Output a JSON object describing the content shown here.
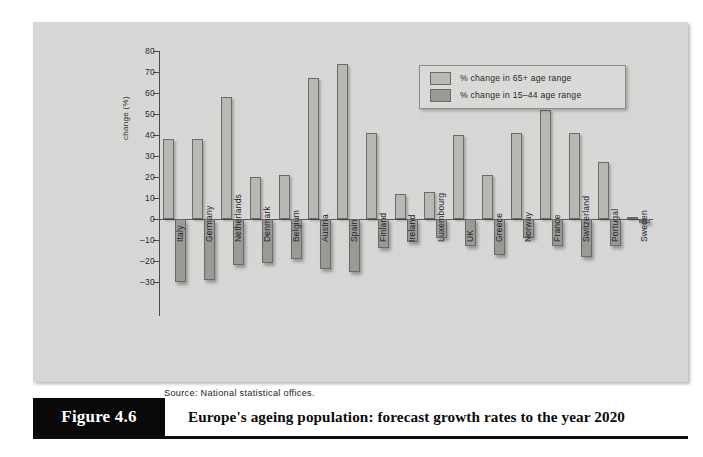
{
  "figure": {
    "number_label": "Figure 4.6",
    "caption": "Europe's ageing population: forecast growth rates to the year 2020",
    "source_note": "Source: National statistical offices."
  },
  "legend": {
    "items": [
      {
        "label": "% change in 65+ age range",
        "color": "#b9b9b6"
      },
      {
        "label": "% change in 15–44 age range",
        "color": "#9a9a97"
      }
    ]
  },
  "axis": {
    "y_title": "change (%)",
    "y_ticks": [
      "80",
      "70",
      "60",
      "50",
      "40",
      "30",
      "20",
      "10",
      "0",
      "–10",
      "–20",
      "–30"
    ]
  },
  "chart_data": {
    "type": "bar",
    "title": "Europe's ageing population: forecast growth rates to the year 2020",
    "xlabel": "",
    "ylabel": "change (%)",
    "ylim": [
      -30,
      80
    ],
    "grid": false,
    "legend_position": "top-right",
    "categories": [
      "Italy",
      "Germany",
      "Netherlands",
      "Denmark",
      "Belgium",
      "Austria",
      "Spain",
      "Finland",
      "Ireland",
      "Luxembourg",
      "UK",
      "Greece",
      "Norway",
      "France",
      "Switzerland",
      "Portugal",
      "Sweden"
    ],
    "series": [
      {
        "name": "% change in 65+ age range",
        "color": "#b9b9b6",
        "values": [
          38,
          38,
          58,
          20,
          21,
          67,
          74,
          41,
          12,
          13,
          40,
          21,
          41,
          52,
          41,
          27,
          0
        ]
      },
      {
        "name": "% change in 15–44 age range",
        "color": "#9a9a97",
        "values": [
          -30,
          -29,
          -22,
          -21,
          -19,
          -24,
          -25,
          -14,
          -11,
          -9,
          -13,
          -17,
          -9,
          -13,
          -18,
          -13,
          -2
        ]
      }
    ]
  }
}
